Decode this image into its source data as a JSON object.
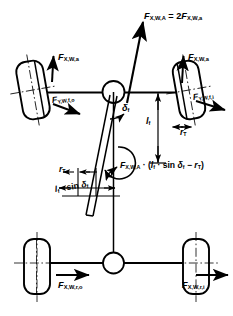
{
  "figure": {
    "type": "technical-diagram",
    "stroke_color": "#000000",
    "background_color": "#ffffff",
    "width": 233,
    "height": 316
  },
  "labels": {
    "resultant_axle_force": {
      "text": "F",
      "sub1": "X,W,A",
      "equals": " = 2",
      "text2": "F",
      "sub2": "X,W,a"
    },
    "front_left_long_force": {
      "text": "F",
      "sub": "X,W,a"
    },
    "front_right_long_force": {
      "text": "F",
      "sub": "X,W,a"
    },
    "front_outer_lateral_force": {
      "text": "F",
      "sub": "Y,W,f,o"
    },
    "front_inner_lateral_force": {
      "text": "F",
      "sub": "Y,W,f,i"
    },
    "steer_angle": {
      "text": "δ",
      "sub": "f"
    },
    "scrub_length": {
      "text": "l",
      "sub": "f"
    },
    "tire_radius_right": {
      "text": "r",
      "sub": "T"
    },
    "tire_radius_left": {
      "text": "r",
      "sub": "T"
    },
    "lever_arm": {
      "text": "l",
      "sub": "f",
      "suffix": " · sin ",
      "delta": "δ",
      "delta_sub": "f"
    },
    "moment_equation": {
      "f": "F",
      "f_sub": "X,W,A",
      "mid": " · (",
      "l": "l",
      "l_sub": "f",
      "dot_sin": " · sin ",
      "delta": "δ",
      "delta_sub": "f",
      "minus": " − ",
      "r": "r",
      "r_sub": "T",
      "close": ")"
    },
    "rear_outer_long_force": {
      "text": "F",
      "sub": "X,W,r,o"
    },
    "rear_inner_long_force": {
      "text": "F",
      "sub": "X,W,r,i"
    }
  },
  "elements": {
    "front_left_wheel": "wheel-rounded-rect-tilted",
    "front_right_wheel": "wheel-rounded-rect-tilted",
    "rear_left_wheel": "wheel-rounded-rect",
    "rear_right_wheel": "wheel-rounded-rect",
    "front_axle_joint": "circle-joint",
    "rear_axle_joint": "circle-joint",
    "steering_axis": "tilted-line",
    "vehicle_centerline": "vertical-line",
    "moment_arrow": "curved-arrow"
  }
}
